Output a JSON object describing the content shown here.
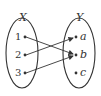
{
  "diagram": {
    "type": "function-mapping",
    "domain_set": {
      "label": "X",
      "elements": [
        "1",
        "2",
        "3"
      ]
    },
    "codomain_set": {
      "label": "Y",
      "elements": [
        "a",
        "b",
        "c"
      ]
    },
    "mappings": [
      {
        "from": "1",
        "to": "b"
      },
      {
        "from": "2",
        "to": "a"
      },
      {
        "from": "3",
        "to": "b"
      }
    ],
    "colors": {
      "stroke": "#333333",
      "background": "#ffffff"
    }
  }
}
